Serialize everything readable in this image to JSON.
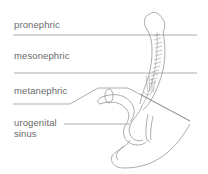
{
  "diagram": {
    "labels": {
      "pronephric": "pronephric",
      "mesonephric": "mesonephric",
      "metanephric": "metanephric",
      "urogenital_line1": "urogenital",
      "urogenital_line2": "sinus"
    },
    "colors": {
      "line": "#8a8a8a",
      "text": "#6a6a6a",
      "background": "#ffffff"
    }
  }
}
